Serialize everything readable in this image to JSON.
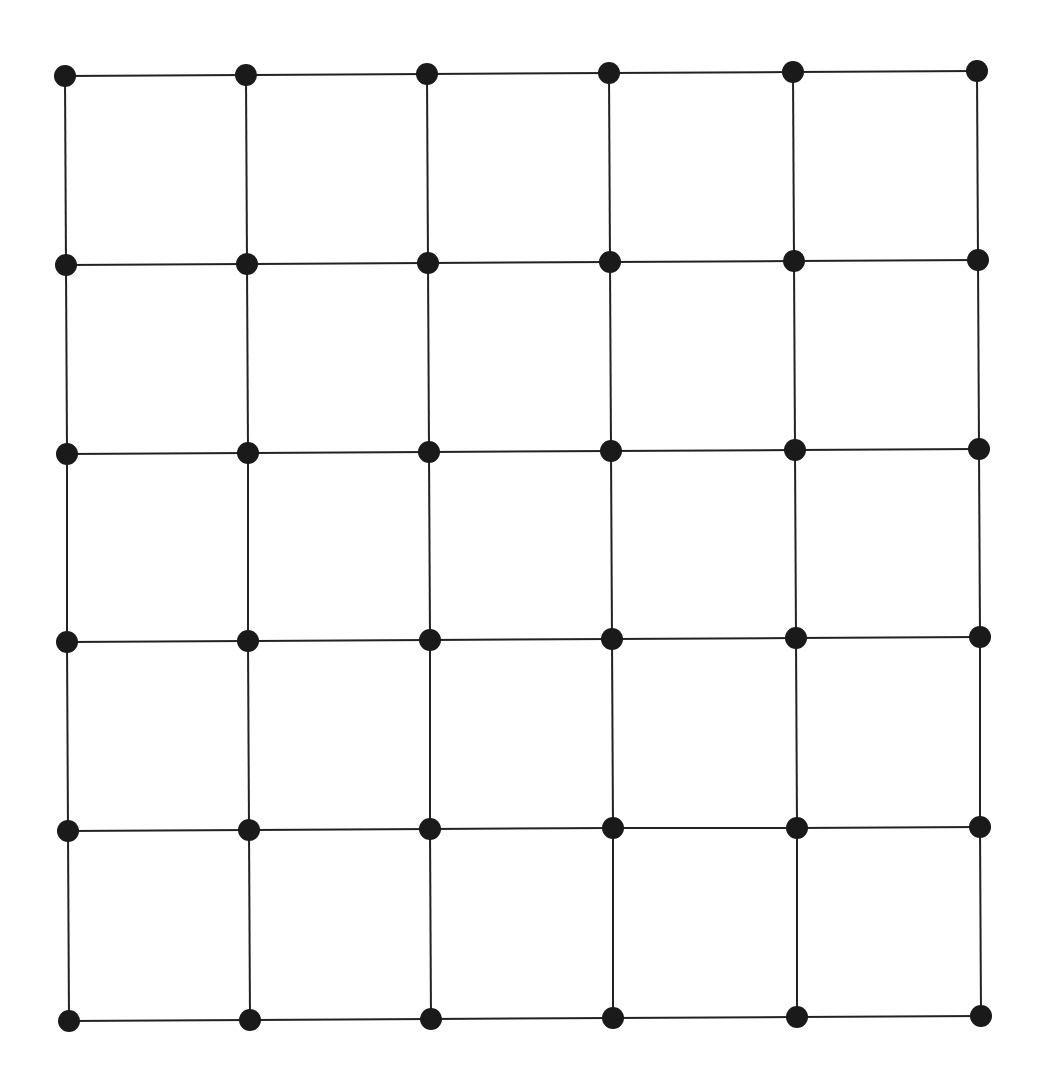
{
  "diagram": {
    "type": "grid-graph",
    "rows": 6,
    "cols": 6,
    "node_color": "#1a1a1a",
    "edge_color": "#222222",
    "node_radius": 11,
    "edge_width": 2,
    "nodes": [
      [
        [
          65,
          76
        ],
        [
          246,
          75
        ],
        [
          427,
          74
        ],
        [
          609,
          73
        ],
        [
          793,
          72
        ],
        [
          977,
          71
        ]
      ],
      [
        [
          66,
          265
        ],
        [
          247,
          264
        ],
        [
          428,
          263
        ],
        [
          610,
          262
        ],
        [
          794,
          261
        ],
        [
          978,
          260
        ]
      ],
      [
        [
          67,
          454
        ],
        [
          248,
          453
        ],
        [
          429,
          452
        ],
        [
          611,
          451
        ],
        [
          795,
          450
        ],
        [
          979,
          449
        ]
      ],
      [
        [
          67,
          642
        ],
        [
          248,
          641
        ],
        [
          430,
          640
        ],
        [
          612,
          639
        ],
        [
          796,
          638
        ],
        [
          980,
          637
        ]
      ],
      [
        [
          68,
          831
        ],
        [
          249,
          830
        ],
        [
          430,
          829
        ],
        [
          613,
          828
        ],
        [
          797,
          828
        ],
        [
          980,
          827
        ]
      ],
      [
        [
          69,
          1021
        ],
        [
          250,
          1020
        ],
        [
          431,
          1019
        ],
        [
          613,
          1018
        ],
        [
          797,
          1017
        ],
        [
          981,
          1016
        ]
      ]
    ]
  }
}
